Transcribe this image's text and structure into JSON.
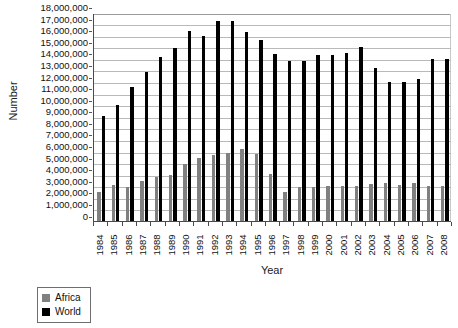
{
  "chart_data": {
    "type": "bar",
    "title": "",
    "subtitle": "",
    "xlabel": "Year",
    "ylabel": "Number",
    "ylim": [
      0,
      18000000
    ],
    "ytick_step": 1000000,
    "grid": true,
    "legend_position": "bottom-left",
    "categories": [
      "1984",
      "1985",
      "1986",
      "1987",
      "1988",
      "1989",
      "1990",
      "1991",
      "1992",
      "1993",
      "1994",
      "1995",
      "1996",
      "1997",
      "1998",
      "1999",
      "2000",
      "2001",
      "2002",
      "2003",
      "2004",
      "2005",
      "2006",
      "2007",
      "2008"
    ],
    "ytick_labels": [
      "18,000,000",
      "17,000,000",
      "16,000,000",
      "15,000,000",
      "14,000,000",
      "13,000,000",
      "12,000,000",
      "11,000,000",
      "10,000,000",
      "9,000,000",
      "8,000,000",
      "7,000,000",
      "6,000,000",
      "5,000,000",
      "4,000,000",
      "3,000,000",
      "2,000,000",
      "1,000,000",
      "0"
    ],
    "series": [
      {
        "name": "Africa",
        "color": "#808080",
        "values": [
          2500000,
          3150000,
          2950000,
          3450000,
          3800000,
          4000000,
          4900000,
          5400000,
          5700000,
          5900000,
          6200000,
          5800000,
          4100000,
          2500000,
          2900000,
          2900000,
          3000000,
          3000000,
          3000000,
          3200000,
          3250000,
          3100000,
          3250000,
          3000000,
          3000000
        ]
      },
      {
        "name": "World",
        "color": "#000000",
        "values": [
          9100000,
          10000000,
          11600000,
          12900000,
          14200000,
          14900000,
          16400000,
          16000000,
          17300000,
          17300000,
          16300000,
          15600000,
          14400000,
          13800000,
          13800000,
          14300000,
          14300000,
          14500000,
          15000000,
          13200000,
          12000000,
          12000000,
          12300000,
          14000000,
          14000000
        ]
      }
    ]
  },
  "legend": {
    "entries": [
      {
        "label": "Africa",
        "color": "#808080"
      },
      {
        "label": "World",
        "color": "#000000"
      }
    ]
  }
}
